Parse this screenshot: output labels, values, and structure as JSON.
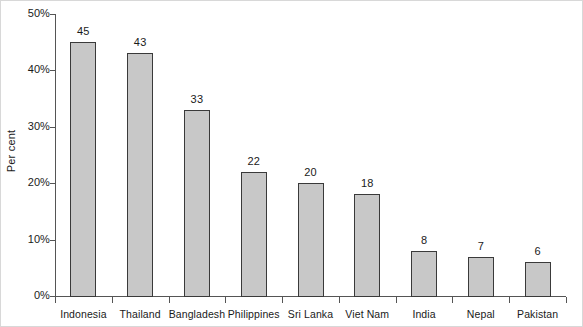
{
  "chart_data": {
    "type": "bar",
    "title": "",
    "subtitle": "",
    "xlabel": "",
    "ylabel": "Per cent",
    "categories": [
      "Indonesia",
      "Thailand",
      "Bangladesh",
      "Philippines",
      "Sri Lanka",
      "Viet Nam",
      "India",
      "Nepal",
      "Pakistan"
    ],
    "values": [
      45,
      43,
      33,
      22,
      20,
      18,
      8,
      7,
      6
    ],
    "value_labels": [
      "45",
      "43",
      "33",
      "22",
      "20",
      "18",
      "8",
      "7",
      "6"
    ],
    "ylim": [
      0,
      50
    ],
    "ytick_values": [
      0,
      10,
      20,
      30,
      40,
      50
    ],
    "ytick_labels": [
      "0%",
      "10%",
      "20%",
      "30%",
      "40%",
      "50%"
    ],
    "grid": false,
    "legend": false,
    "legend_position": "none",
    "bar_fill_color": "#c8c8c8",
    "bar_edge_color": "#3a3a3a",
    "axis_color": "#555555",
    "background_color": "#ffffff"
  }
}
